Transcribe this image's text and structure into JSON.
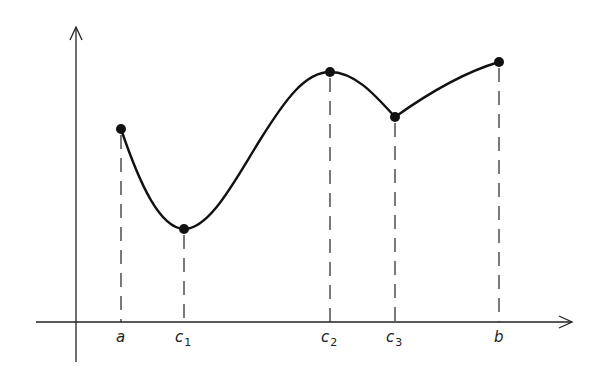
{
  "diagram": {
    "x_axis_labels": [
      {
        "id": "a",
        "text": "a",
        "sub": ""
      },
      {
        "id": "c1",
        "text": "c",
        "sub": "1"
      },
      {
        "id": "c2",
        "text": "c",
        "sub": "2"
      },
      {
        "id": "c3",
        "text": "c",
        "sub": "3"
      },
      {
        "id": "b",
        "text": "b",
        "sub": ""
      }
    ],
    "points": [
      {
        "label": "a",
        "x": 121,
        "y": 129,
        "kind": "endpoint"
      },
      {
        "label": "c1",
        "x": 184,
        "y": 229,
        "kind": "local-minimum"
      },
      {
        "label": "c2",
        "x": 330,
        "y": 72,
        "kind": "local-maximum"
      },
      {
        "label": "c3",
        "x": 395,
        "y": 117,
        "kind": "local-minimum-corner"
      },
      {
        "label": "b",
        "x": 499,
        "y": 62,
        "kind": "endpoint"
      }
    ],
    "colors": {
      "stroke": "#111111",
      "background": "#ffffff"
    }
  }
}
